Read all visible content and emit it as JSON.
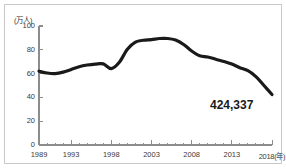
{
  "chart_data": {
    "type": "line",
    "title": "",
    "subtitle": "",
    "xlabel": "年",
    "ylabel": "万人",
    "unit_label": "(万人)",
    "x_axis_suffix": "(年)",
    "xlim": [
      1989,
      2018
    ],
    "ylim": [
      0,
      100
    ],
    "grid": false,
    "legend": null,
    "y_ticks": [
      100,
      80,
      60,
      40,
      20,
      0
    ],
    "x_ticks": [
      1989,
      1993,
      1998,
      2003,
      2008,
      2013,
      2018
    ],
    "x_minor_tick_interval": 1,
    "line_color": "#1a1a1a",
    "line_width_px": 3.2,
    "annotations": [
      {
        "text": "424,337",
        "x": 2017,
        "y": 33,
        "anchor": "line-end"
      }
    ],
    "x": [
      1989,
      1990,
      1991,
      1992,
      1993,
      1994,
      1995,
      1996,
      1997,
      1998,
      1999,
      2000,
      2001,
      2002,
      2003,
      2004,
      2005,
      2006,
      2007,
      2008,
      2009,
      2010,
      2011,
      2012,
      2013,
      2014,
      2015,
      2016,
      2017,
      2018
    ],
    "series": [
      {
        "name": "出生数",
        "values": [
          62.0,
          60.5,
          60.0,
          61.2,
          63.5,
          65.8,
          67.2,
          68.0,
          68.2,
          64.2,
          69.5,
          80.5,
          86.5,
          88.0,
          88.5,
          89.5,
          89.5,
          88.2,
          84.5,
          79.0,
          75.0,
          74.0,
          72.0,
          70.2,
          68.0,
          65.0,
          62.5,
          57.5,
          50.0,
          42.4
        ]
      }
    ]
  },
  "figure": {
    "background_color": "#ffffff",
    "border_color": "#c9c9c9"
  }
}
